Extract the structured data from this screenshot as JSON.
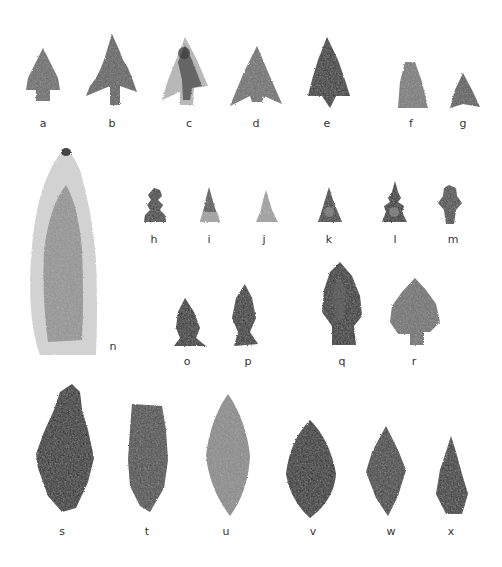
{
  "plate": {
    "description": "Photographic plate of projectile points (arrowheads), labeled a through x",
    "background": "#ffffff",
    "rows": [
      {
        "row": 1,
        "items": [
          {
            "label": "a",
            "shape": "stemmed-barbed",
            "tone": "#6b6b6b"
          },
          {
            "label": "b",
            "shape": "stemmed-serrated-barbed",
            "tone": "#5e5e5e"
          },
          {
            "label": "c",
            "shape": "stemmed-barbed-mottled",
            "tone": "#7a7a7a"
          },
          {
            "label": "d",
            "shape": "barbed-triangular",
            "tone": "#6e6e6e"
          },
          {
            "label": "e",
            "shape": "barbed-pointed",
            "tone": "#2e2e2e"
          },
          {
            "label": "f",
            "shape": "triangular",
            "tone": "#7a7a7a"
          },
          {
            "label": "g",
            "shape": "small-triangular-concave",
            "tone": "#5a5a5a"
          }
        ]
      },
      {
        "row": 2,
        "items": [
          {
            "label": "n",
            "shape": "large-lanceolate-blade",
            "tone": "#8a8a8a"
          },
          {
            "label": "h",
            "shape": "miniature-serrated",
            "tone": "#3c3c3c"
          },
          {
            "label": "i",
            "shape": "miniature-serrated",
            "tone": "#555555"
          },
          {
            "label": "j",
            "shape": "miniature-serrated",
            "tone": "#a0a0a0"
          },
          {
            "label": "k",
            "shape": "miniature-serrated",
            "tone": "#3a3a3a"
          },
          {
            "label": "l",
            "shape": "miniature-serrated",
            "tone": "#2e2e2e"
          },
          {
            "label": "m",
            "shape": "miniature-diamond",
            "tone": "#4a4a4a"
          }
        ]
      },
      {
        "row": 3,
        "items": [
          {
            "label": "o",
            "shape": "stemmed-small",
            "tone": "#2c2c2c"
          },
          {
            "label": "p",
            "shape": "stemmed-small",
            "tone": "#2e2e2e"
          },
          {
            "label": "q",
            "shape": "stemmed-lanceolate",
            "tone": "#2a2a2a"
          },
          {
            "label": "r",
            "shape": "stemmed-barbed-broad",
            "tone": "#707070"
          }
        ]
      },
      {
        "row": 4,
        "items": [
          {
            "label": "s",
            "shape": "leaf-large",
            "tone": "#262626"
          },
          {
            "label": "t",
            "shape": "leaf-truncated",
            "tone": "#4a4a4a"
          },
          {
            "label": "u",
            "shape": "leaf-bipointed",
            "tone": "#8a8a8a"
          },
          {
            "label": "v",
            "shape": "leaf-ovate",
            "tone": "#262626"
          },
          {
            "label": "w",
            "shape": "leaf-diamond",
            "tone": "#3c3c3c"
          },
          {
            "label": "x",
            "shape": "leaf-narrow",
            "tone": "#303030"
          }
        ]
      }
    ]
  },
  "labels": {
    "a": "a",
    "b": "b",
    "c": "c",
    "d": "d",
    "e": "e",
    "f": "f",
    "g": "g",
    "h": "h",
    "i": "i",
    "j": "j",
    "k": "k",
    "l": "l",
    "m": "m",
    "n": "n",
    "o": "o",
    "p": "p",
    "q": "q",
    "r": "r",
    "s": "s",
    "t": "t",
    "u": "u",
    "v": "v",
    "w": "w",
    "x": "x"
  }
}
